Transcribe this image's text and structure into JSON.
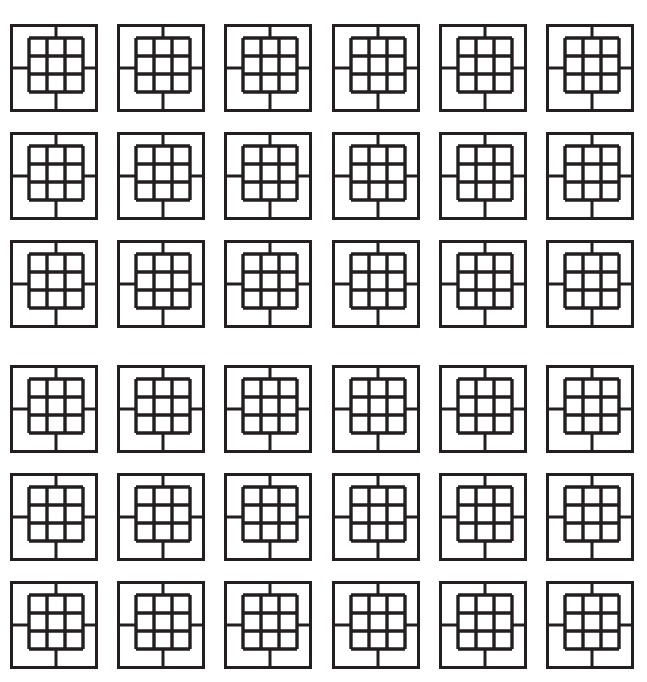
{
  "artwork": {
    "title": "Square Lattice Tile Pattern",
    "description": "Repeating geometric motif of concentric squares with a nine-square inner grid",
    "background_color": "#ffffff",
    "line_color": "#231f20",
    "canvas": {
      "width": 647,
      "height": 682
    }
  },
  "grid": {
    "columns": 6,
    "rows": 6,
    "column_pitch": 107.2,
    "row_pitch": 107.8,
    "origin_x": 10,
    "origin_y": 24,
    "row_band_break_after": 3,
    "row_band_extra_gap": 18,
    "total_tiles": 36
  },
  "tile": {
    "name": "square-lattice-motif",
    "outer": {
      "x": 0,
      "y": 0,
      "size": 88,
      "stroke_width": 3
    },
    "inner": {
      "offset_x": 19,
      "offset_y": 14,
      "size": 54,
      "cells": 3,
      "stroke_width": 3.4
    },
    "connectors": {
      "stroke_width": 3,
      "top_x": 46,
      "bottom_x": 46,
      "left_y": 44,
      "right_y": 44
    }
  },
  "chart_data": {
    "type": "heatmap",
    "xlabel": "",
    "ylabel": "",
    "categories": [
      "C1",
      "C2",
      "C3",
      "C4",
      "C5",
      "C6"
    ],
    "rows": [
      "R1",
      "R2",
      "R3",
      "R4",
      "R5",
      "R6"
    ],
    "values": [
      [
        1,
        1,
        1,
        1,
        1,
        1
      ],
      [
        1,
        1,
        1,
        1,
        1,
        1
      ],
      [
        1,
        1,
        1,
        1,
        1,
        1
      ],
      [
        1,
        1,
        1,
        1,
        1,
        1
      ],
      [
        1,
        1,
        1,
        1,
        1,
        1
      ],
      [
        1,
        1,
        1,
        1,
        1,
        1
      ]
    ],
    "grid": false,
    "legend_position": "none"
  }
}
